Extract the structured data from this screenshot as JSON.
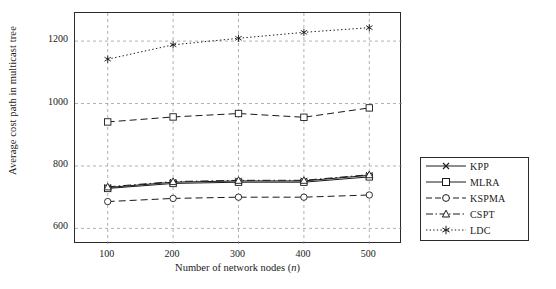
{
  "chart_data": {
    "type": "line",
    "title": "",
    "xlabel": "Number of network nodes (n)",
    "ylabel": "Average cost path in multicast tree",
    "categories": [
      "100",
      "200",
      "300",
      "400",
      "500"
    ],
    "x": [
      100,
      200,
      300,
      400,
      500
    ],
    "xlim": [
      50,
      550
    ],
    "ylim": [
      550,
      1290
    ],
    "yticks": [
      "600",
      "800",
      "1000",
      "1200"
    ],
    "ytick_values": [
      600,
      800,
      1000,
      1200
    ],
    "grid": true,
    "legend_position": "right",
    "series": [
      {
        "name": "KPP",
        "marker": "x",
        "dash": "solid",
        "values": [
          731,
          748,
          752,
          752,
          770
        ]
      },
      {
        "name": "MLRA",
        "marker": "square",
        "dash": "solid",
        "values": [
          728,
          744,
          748,
          748,
          765
        ]
      },
      {
        "name": "KSPMA",
        "marker": "circle",
        "dash": "dashed",
        "values": [
          686,
          696,
          700,
          700,
          707
        ]
      },
      {
        "name": "CSPT",
        "marker": "triangle",
        "dash": "dashdot",
        "values": [
          733,
          750,
          754,
          754,
          772
        ]
      },
      {
        "name": "LDC",
        "marker": "asterisk",
        "dash": "dotted",
        "values": [
          1142,
          1188,
          1209,
          1228,
          1243
        ]
      }
    ],
    "extra_series_note": "second dashed series with square markers near 940-985",
    "series_extra": [
      {
        "name": "MLRA-upper",
        "marker": "square",
        "dash": "dashed",
        "values": [
          941,
          957,
          968,
          956,
          986
        ]
      }
    ]
  },
  "legend": {
    "items": [
      {
        "label": "KPP"
      },
      {
        "label": "MLRA"
      },
      {
        "label": "KSPMA"
      },
      {
        "label": "CSPT"
      },
      {
        "label": "LDC"
      }
    ]
  },
  "axes": {
    "x_label_main": "Number of network nodes (",
    "x_label_italic": "n",
    "x_label_tail": ")",
    "y_label": "Average cost path in multicast tree"
  }
}
